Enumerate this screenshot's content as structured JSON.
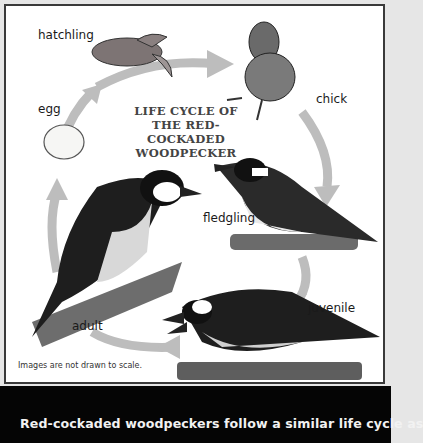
{
  "diagram": {
    "title_lines": [
      "LIFE CYCLE OF",
      "THE RED-COCKADED",
      "WOODPECKER"
    ],
    "stages": [
      {
        "id": "egg",
        "label": "egg"
      },
      {
        "id": "hatchling",
        "label": "hatchling"
      },
      {
        "id": "chick",
        "label": "chick"
      },
      {
        "id": "fledgling",
        "label": "fledgling"
      },
      {
        "id": "juvenile",
        "label": "juvenile"
      },
      {
        "id": "adult",
        "label": "adult"
      }
    ],
    "note": "Images are not drawn to scale.",
    "caption": "Red-cockaded woodpeckers follow a similar life cycle as",
    "colors": {
      "arrow": "#b8b8b8",
      "caption_bg": "#050505",
      "caption_text": "#f2f2f2",
      "frame_bg": "#e6e6e6"
    }
  }
}
